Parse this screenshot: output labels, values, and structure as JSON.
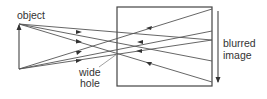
{
  "diagram": {
    "labels": {
      "object": "object",
      "hole_line1": "wide",
      "hole_line2": "hole",
      "image_line1": "blurred",
      "image_line2": "image"
    },
    "colors": {
      "stroke": "#555555",
      "box": "#444444",
      "text": "#333333"
    }
  }
}
